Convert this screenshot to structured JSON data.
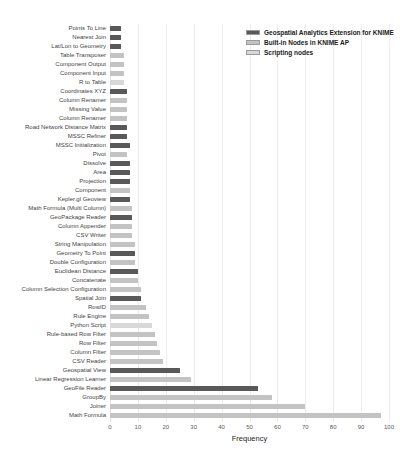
{
  "figure": {
    "xlabel": "Frequency"
  },
  "legend": {
    "items": [
      {
        "label": "Geospatial Analytics Extension for KNIME",
        "group": "geospatial"
      },
      {
        "label": "Built-in Nodes in KNIME AP",
        "group": "builtin"
      },
      {
        "label": "Scripting nodes",
        "group": "scripting"
      }
    ]
  },
  "colors": {
    "geospatial": "#595959",
    "builtin": "#c3c3c3",
    "scripting": "#d8d8d8",
    "gridline": "#ededed",
    "tick_text": "#595959",
    "label_text": "#3f3f3f"
  },
  "chart_data": {
    "type": "bar",
    "orientation": "horizontal",
    "title": "",
    "xlabel": "Frequency",
    "ylabel": "",
    "xlim": [
      0,
      100
    ],
    "x_ticks": [
      0,
      10,
      20,
      30,
      40,
      50,
      60,
      70,
      80,
      90,
      100
    ],
    "grid": true,
    "legend_position": "top-right",
    "bars": [
      {
        "label": "Points To Line",
        "value": 4,
        "group": "geospatial"
      },
      {
        "label": "Nearest Join",
        "value": 4,
        "group": "geospatial"
      },
      {
        "label": "Lat/Lon to Geometry",
        "value": 4,
        "group": "geospatial"
      },
      {
        "label": "Table Transposer",
        "value": 5,
        "group": "builtin"
      },
      {
        "label": "Component Output",
        "value": 5,
        "group": "builtin"
      },
      {
        "label": "Component Input",
        "value": 5,
        "group": "builtin"
      },
      {
        "label": "R to Table",
        "value": 5,
        "group": "scripting"
      },
      {
        "label": "Coordinates XYZ",
        "value": 6,
        "group": "geospatial"
      },
      {
        "label": "Column Renamer",
        "value": 6,
        "group": "builtin"
      },
      {
        "label": "Missing Value",
        "value": 6,
        "group": "builtin"
      },
      {
        "label": "Column Renamer",
        "value": 6,
        "group": "builtin"
      },
      {
        "label": "Road Network Distance Matrix",
        "value": 6,
        "group": "geospatial"
      },
      {
        "label": "MSSC Refiner",
        "value": 6,
        "group": "geospatial"
      },
      {
        "label": "MSSC Initialization",
        "value": 7,
        "group": "geospatial"
      },
      {
        "label": "Pivot",
        "value": 6,
        "group": "builtin"
      },
      {
        "label": "Dissolve",
        "value": 7,
        "group": "geospatial"
      },
      {
        "label": "Area",
        "value": 7,
        "group": "geospatial"
      },
      {
        "label": "Projection",
        "value": 7,
        "group": "geospatial"
      },
      {
        "label": "Component",
        "value": 7,
        "group": "builtin"
      },
      {
        "label": "Kepler.gl Geoview",
        "value": 7,
        "group": "geospatial"
      },
      {
        "label": "Math Formula (Multi Column)",
        "value": 8,
        "group": "builtin"
      },
      {
        "label": "GeoPackage Reader",
        "value": 8,
        "group": "geospatial"
      },
      {
        "label": "Column Appender",
        "value": 8,
        "group": "builtin"
      },
      {
        "label": "CSV Writer",
        "value": 8,
        "group": "builtin"
      },
      {
        "label": "String Manipulation",
        "value": 9,
        "group": "builtin"
      },
      {
        "label": "Geometry To Point",
        "value": 9,
        "group": "geospatial"
      },
      {
        "label": "Double Configuration",
        "value": 9,
        "group": "builtin"
      },
      {
        "label": "Euclidean Distance",
        "value": 10,
        "group": "geospatial"
      },
      {
        "label": "Concatenate",
        "value": 10,
        "group": "builtin"
      },
      {
        "label": "Column Selection Configuration",
        "value": 11,
        "group": "builtin"
      },
      {
        "label": "Spatial Join",
        "value": 11,
        "group": "geospatial"
      },
      {
        "label": "RowID",
        "value": 13,
        "group": "builtin"
      },
      {
        "label": "Rule Engine",
        "value": 14,
        "group": "builtin"
      },
      {
        "label": "Python Script",
        "value": 15,
        "group": "scripting"
      },
      {
        "label": "Rule-based Row Filter",
        "value": 16,
        "group": "builtin"
      },
      {
        "label": "Row Filter",
        "value": 17,
        "group": "builtin"
      },
      {
        "label": "Column Filter",
        "value": 18,
        "group": "builtin"
      },
      {
        "label": "CSV Reader",
        "value": 19,
        "group": "builtin"
      },
      {
        "label": "Geospatial View",
        "value": 25,
        "group": "geospatial"
      },
      {
        "label": "Linear Regression Learner",
        "value": 29,
        "group": "builtin"
      },
      {
        "label": "GeoFile Reader",
        "value": 53,
        "group": "geospatial"
      },
      {
        "label": "GroupBy",
        "value": 58,
        "group": "builtin"
      },
      {
        "label": "Joiner",
        "value": 70,
        "group": "builtin"
      },
      {
        "label": "Math Formula",
        "value": 97,
        "group": "builtin"
      }
    ]
  }
}
